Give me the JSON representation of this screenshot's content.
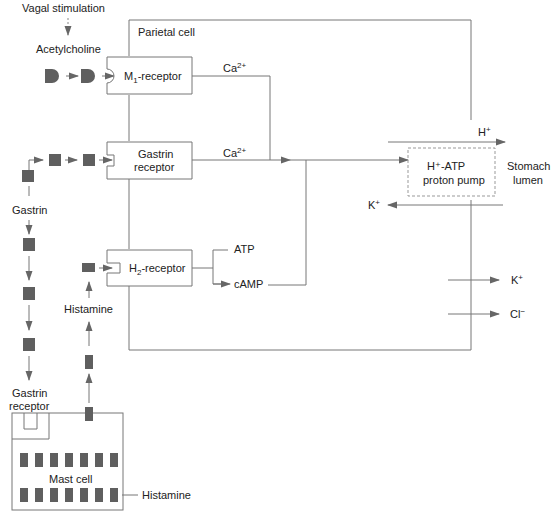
{
  "labels": {
    "vagal": "Vagal stimulation",
    "acetylcholine": "Acetylcholine",
    "parietal_cell": "Parietal cell",
    "m1_receptor": "M",
    "m1_sub": "1",
    "m1_suffix": "-receptor",
    "ca1": "Ca",
    "ca1_sup": "2+",
    "ca2": "Ca",
    "ca2_sup": "2+",
    "gastrin_receptor_l1": "Gastrin",
    "gastrin_receptor_l2": "receptor",
    "h_plus": "H",
    "h_plus_sup": "+",
    "pump_l1": "H⁺-ATP",
    "pump_l2": "proton pump",
    "lumen_l1": "Stomach",
    "lumen_l2": "lumen",
    "k_in": "K",
    "k_in_sup": "+",
    "gastrin": "Gastrin",
    "h2_receptor": "H",
    "h2_sub": "2",
    "h2_suffix": "-receptor",
    "atp": "ATP",
    "camp": "cAMP",
    "histamine_up": "Histamine",
    "k_out": "K",
    "k_out_sup": "+",
    "cl_out": "Cl",
    "cl_out_sup": "−",
    "gastrin_rec_mast_l1": "Gastrin",
    "gastrin_rec_mast_l2": "receptor",
    "mast_cell": "Mast cell",
    "histamine_granules": "Histamine"
  },
  "colors": {
    "line": "#777777",
    "block": "#5f5f5f",
    "text": "#222222"
  }
}
